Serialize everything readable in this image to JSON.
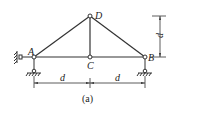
{
  "diagram": {
    "type": "truss",
    "caption": "(a)",
    "nodes": {
      "A": {
        "label": "A",
        "x": 34,
        "y": 57
      },
      "B": {
        "label": "B",
        "x": 145,
        "y": 57
      },
      "C": {
        "label": "C",
        "x": 90,
        "y": 57
      },
      "D": {
        "label": "D",
        "x": 90,
        "y": 16
      }
    },
    "members": [
      [
        "A",
        "C"
      ],
      [
        "C",
        "B"
      ],
      [
        "A",
        "D"
      ],
      [
        "D",
        "B"
      ],
      [
        "C",
        "D"
      ]
    ],
    "dimensions": {
      "horizontal_left": "d",
      "horizontal_right": "d",
      "vertical": "d"
    },
    "supports": {
      "A": "pin with horizontal restraint",
      "B": "roller"
    },
    "colors": {
      "line": "#333333",
      "background": "#ffffff"
    }
  }
}
